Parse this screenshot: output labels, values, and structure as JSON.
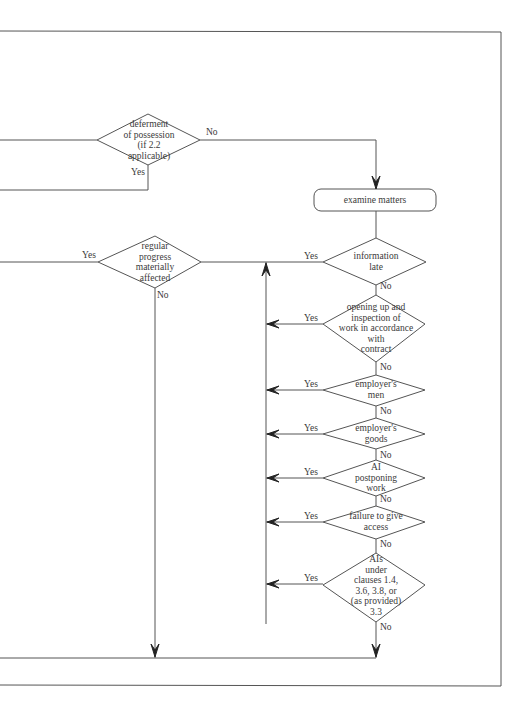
{
  "diagram": {
    "type": "flowchart",
    "colors": {
      "line": "#555555",
      "text": "#3a3a3a",
      "background": "#ffffff"
    },
    "nodes": [
      {
        "id": "deferment",
        "shape": "diamond",
        "lines": [
          "deferment",
          "of possession",
          "(if 2.2",
          "applicable)"
        ]
      },
      {
        "id": "examine",
        "shape": "rounded-rect",
        "label": "examine matters"
      },
      {
        "id": "regular_progress",
        "shape": "diamond",
        "lines": [
          "regular",
          "progress",
          "materially",
          "affected"
        ]
      },
      {
        "id": "information_late",
        "shape": "diamond",
        "lines": [
          "information",
          "late"
        ]
      },
      {
        "id": "opening_up",
        "shape": "diamond",
        "lines": [
          "opening up and",
          "inspection of",
          "work in accordance",
          "with",
          "contract"
        ]
      },
      {
        "id": "employers_men",
        "shape": "diamond",
        "lines": [
          "employer's",
          "men"
        ]
      },
      {
        "id": "employers_goods",
        "shape": "diamond",
        "lines": [
          "employer's",
          "goods"
        ]
      },
      {
        "id": "ai_postponing",
        "shape": "diamond",
        "lines": [
          "AI",
          "postponing",
          "work"
        ]
      },
      {
        "id": "failure_access",
        "shape": "diamond",
        "lines": [
          "failure to give",
          "access"
        ]
      },
      {
        "id": "ais_under_clauses",
        "shape": "diamond",
        "lines": [
          "AIs",
          "under",
          "clauses 1.4,",
          "3.6, 3.8, or",
          "(as provided)",
          "3.3"
        ]
      }
    ],
    "edge_labels": {
      "deferment_no": "No",
      "deferment_yes": "Yes",
      "regular_progress_yes": "Yes",
      "regular_progress_no": "No",
      "information_late_yes": "Yes",
      "information_late_no": "No",
      "opening_up_yes": "Yes",
      "opening_up_no": "No",
      "employers_men_yes": "Yes",
      "employers_men_no": "No",
      "employers_goods_yes": "Yes",
      "employers_goods_no": "No",
      "ai_postponing_yes": "Yes",
      "ai_postponing_no": "No",
      "failure_access_yes": "Yes",
      "failure_access_no": "No",
      "ais_under_clauses_yes": "Yes",
      "ais_under_clauses_no": "No"
    }
  }
}
